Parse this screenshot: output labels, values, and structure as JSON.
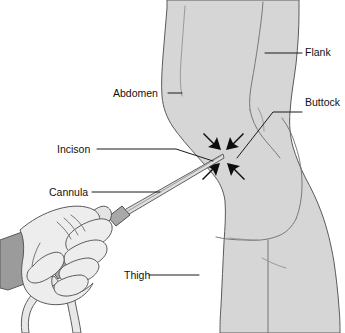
{
  "figure": {
    "background_color": "#ffffff",
    "width": 345,
    "height": 333
  },
  "palette": {
    "body_fill": "#d6d6d6",
    "body_outline": "#5a5a5a",
    "contour_line": "#6e6e6e",
    "glove_fill": "#ededed",
    "cuff_fill": "#9b9b9b",
    "handle_fill": "#e4e4e4",
    "collar_fill": "#a8a8a8",
    "shaft_fill": "#dedede",
    "arrow_color": "#0d0d0d",
    "label_color": "#111111",
    "leader_color": "#1a1a1a"
  },
  "labels": [
    {
      "id": "flank",
      "text": "Flank",
      "side": "right",
      "text_x": 305,
      "text_y": 56,
      "anchor": "start"
    },
    {
      "id": "abdomen",
      "text": "Abdomen",
      "side": "left",
      "text_x": 113,
      "text_y": 97,
      "anchor": "start"
    },
    {
      "id": "buttock",
      "text": "Buttock",
      "side": "right",
      "text_x": 305,
      "text_y": 106,
      "anchor": "start"
    },
    {
      "id": "incison",
      "text": "Incison",
      "side": "left",
      "text_x": 57,
      "text_y": 153,
      "anchor": "start"
    },
    {
      "id": "cannula",
      "text": "Cannula",
      "side": "left",
      "text_x": 49,
      "text_y": 196,
      "anchor": "start"
    },
    {
      "id": "thigh",
      "text": "Thigh",
      "side": "left",
      "text_x": 124,
      "text_y": 279,
      "anchor": "start"
    }
  ],
  "arrows": {
    "count": 4,
    "target_x": 222,
    "target_y": 155,
    "description": "four converging arrows marking the treatment site"
  },
  "instrument": {
    "name": "liposuction-cannula",
    "parts": [
      "handpiece",
      "collar",
      "shaft",
      "suction-tubes"
    ],
    "tube_count": 2
  },
  "hand": {
    "name": "gloved-hand",
    "finger_count": 4,
    "has_cuff": true
  }
}
